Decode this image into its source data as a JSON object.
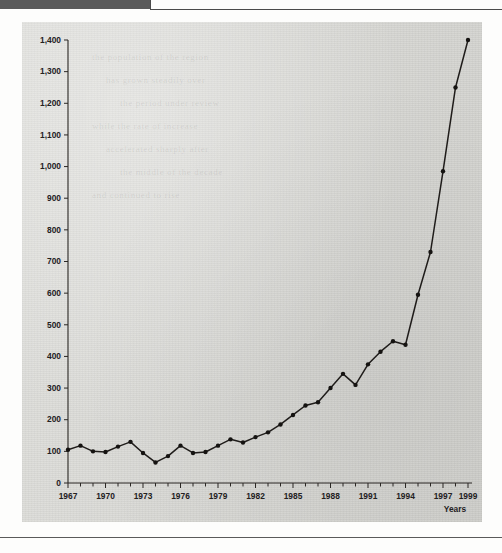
{
  "page": {
    "header_bar_color": "#5a5a5a",
    "plate_color": "#dcdcd8",
    "ink_color": "#1f1c1a"
  },
  "chart_data": {
    "type": "line",
    "title": "",
    "subtitle": "",
    "xlabel": "Years",
    "ylabel": "",
    "xlim": [
      1967,
      1999
    ],
    "ylim": [
      0,
      1400
    ],
    "grid": false,
    "legend": null,
    "y_ticks": [
      0,
      100,
      200,
      300,
      400,
      500,
      600,
      700,
      800,
      900,
      1000,
      1100,
      1200,
      1300,
      1400
    ],
    "y_tick_labels": [
      "0",
      "100",
      "200",
      "300",
      "400",
      "500",
      "600",
      "700",
      "800",
      "900",
      "1,000",
      "1,100",
      "1,200",
      "1,300",
      "1,400"
    ],
    "x_ticks": [
      1967,
      1970,
      1973,
      1976,
      1979,
      1982,
      1985,
      1988,
      1991,
      1994,
      1997,
      1999
    ],
    "x_tick_labels": [
      "1967",
      "1970",
      "1973",
      "1976",
      "1979",
      "1982",
      "1985",
      "1988",
      "1991",
      "1994",
      "1997",
      "1999"
    ],
    "x_minor_ticks_every": 1,
    "marker": "filled-circle",
    "x": [
      1967,
      1968,
      1969,
      1970,
      1971,
      1972,
      1973,
      1974,
      1975,
      1976,
      1977,
      1978,
      1979,
      1980,
      1981,
      1982,
      1983,
      1984,
      1985,
      1986,
      1987,
      1988,
      1989,
      1990,
      1991,
      1992,
      1993,
      1994,
      1995,
      1996,
      1997,
      1998,
      1999
    ],
    "values": [
      105,
      118,
      100,
      98,
      115,
      130,
      95,
      65,
      85,
      118,
      95,
      98,
      118,
      138,
      128,
      145,
      160,
      185,
      215,
      245,
      255,
      300,
      345,
      310,
      375,
      415,
      448,
      437,
      595,
      730,
      985,
      1250,
      1400
    ]
  },
  "ghost_text_lines": [
    "the population of the region",
    "has grown steadily over",
    "the period under review",
    "while the rate of increase",
    "accelerated sharply after",
    "the middle of the decade",
    "and continued to rise"
  ]
}
